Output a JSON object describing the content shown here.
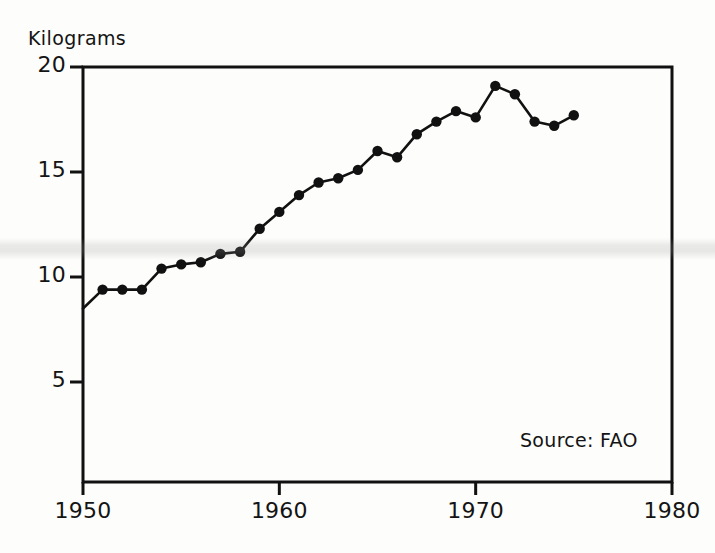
{
  "chart_data": {
    "type": "line",
    "title": "",
    "subtitle": "",
    "xlabel": "",
    "ylabel": "Kilograms",
    "xlim": [
      1950,
      1980
    ],
    "ylim": [
      0,
      20
    ],
    "xticks": [
      1950,
      1960,
      1970,
      1980
    ],
    "yticks": [
      5,
      10,
      15,
      20
    ],
    "grid": false,
    "legend": false,
    "markers": "filled-circle",
    "line_color": "#111111",
    "annotation": "Source: FAO",
    "x": [
      1950,
      1951,
      1952,
      1953,
      1954,
      1955,
      1956,
      1957,
      1958,
      1959,
      1960,
      1961,
      1962,
      1963,
      1964,
      1965,
      1966,
      1967,
      1968,
      1969,
      1970,
      1971,
      1972,
      1973,
      1974,
      1975
    ],
    "values": [
      8.5,
      9.4,
      9.4,
      9.4,
      10.4,
      10.6,
      10.7,
      11.1,
      11.2,
      12.3,
      13.1,
      13.9,
      14.5,
      14.7,
      15.1,
      16.0,
      15.7,
      16.8,
      17.4,
      17.9,
      17.6,
      19.1,
      18.7,
      17.4,
      17.2,
      17.7
    ],
    "series": [
      {
        "name": "Kilograms per capita",
        "values": [
          8.5,
          9.4,
          9.4,
          9.4,
          10.4,
          10.6,
          10.7,
          11.1,
          11.2,
          12.3,
          13.1,
          13.9,
          14.5,
          14.7,
          15.1,
          16.0,
          15.7,
          16.8,
          17.4,
          17.9,
          17.6,
          19.1,
          18.7,
          17.4,
          17.2,
          17.7
        ]
      }
    ]
  },
  "axis": {
    "y_label": "Kilograms",
    "y_tick_labels": [
      "20",
      "15",
      "10",
      "5"
    ],
    "x_tick_labels": [
      "1950",
      "1960",
      "1970",
      "1980"
    ]
  },
  "notes": {
    "source": "Source: FAO"
  }
}
